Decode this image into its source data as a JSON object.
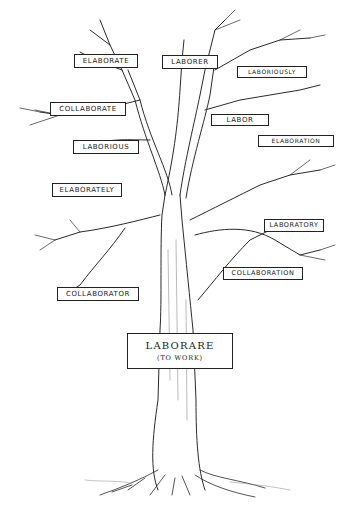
{
  "figure": {
    "type": "word-family tree illustration",
    "root": {
      "word": "LABORARE",
      "gloss": "(TO WORK)"
    },
    "branches": [
      {
        "id": "elaborate",
        "label": "ELABORATE",
        "x": 74,
        "y": 54,
        "w": 64,
        "h": 14
      },
      {
        "id": "laborer",
        "label": "LABORER",
        "x": 162,
        "y": 55,
        "w": 56,
        "h": 14
      },
      {
        "id": "laboriously",
        "label": "LABORIOUSLY",
        "x": 237,
        "y": 66,
        "w": 70,
        "h": 12
      },
      {
        "id": "collaborate",
        "label": "COLLABORATE",
        "x": 50,
        "y": 102,
        "w": 76,
        "h": 14
      },
      {
        "id": "labor",
        "label": "LABOR",
        "x": 211,
        "y": 114,
        "w": 58,
        "h": 12
      },
      {
        "id": "laborious",
        "label": "LABORIOUS",
        "x": 73,
        "y": 140,
        "w": 66,
        "h": 14
      },
      {
        "id": "elaboration",
        "label": "ELABORATION",
        "x": 258,
        "y": 135,
        "w": 76,
        "h": 12
      },
      {
        "id": "elaborately",
        "label": "ELABORATELY",
        "x": 52,
        "y": 183,
        "w": 70,
        "h": 14
      },
      {
        "id": "laboratory",
        "label": "LABORATORY",
        "x": 264,
        "y": 219,
        "w": 60,
        "h": 13
      },
      {
        "id": "collaboration",
        "label": "COLLABORATION",
        "x": 223,
        "y": 267,
        "w": 80,
        "h": 13
      },
      {
        "id": "collaborator",
        "label": "COLLABORATOR",
        "x": 57,
        "y": 287,
        "w": 82,
        "h": 14
      }
    ],
    "colors": {
      "ink": "#222222",
      "background": "#ffffff"
    }
  }
}
